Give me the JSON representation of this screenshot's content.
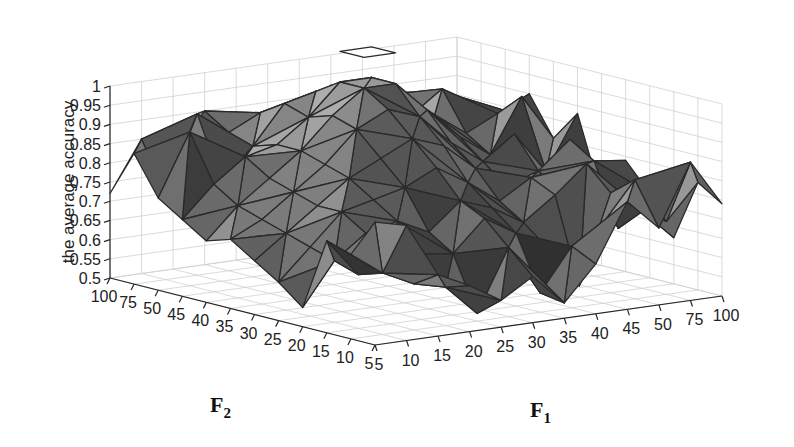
{
  "chart_data": {
    "type": "surface3d",
    "title": "",
    "zlabel": "the average accuracy",
    "xlabel": "F1",
    "ylabel": "F2",
    "xlabel_main": "F",
    "xlabel_sub": "1",
    "ylabel_main": "F",
    "ylabel_sub": "2",
    "x_ticks": [
      "5",
      "10",
      "15",
      "20",
      "25",
      "30",
      "35",
      "40",
      "45",
      "50",
      "75",
      "100"
    ],
    "y_ticks": [
      "5",
      "10",
      "15",
      "20",
      "25",
      "30",
      "35",
      "40",
      "45",
      "50",
      "75",
      "100"
    ],
    "z_ticks": [
      "0.5",
      "0.55",
      "0.6",
      "0.65",
      "0.7",
      "0.75",
      "0.8",
      "0.85",
      "0.9",
      "0.95",
      "1"
    ],
    "zlim": [
      0.5,
      1.0
    ],
    "grid": true,
    "colormap": "gray (faceted shading)",
    "z": [
      [
        0.82,
        0.8,
        0.66,
        0.62,
        0.57,
        0.62,
        0.54,
        0.63,
        0.78,
        0.7,
        0.86,
        0.74
      ],
      [
        0.72,
        0.66,
        0.62,
        0.6,
        0.52,
        0.68,
        0.55,
        0.66,
        0.71,
        0.81,
        0.69,
        0.78
      ],
      [
        0.74,
        0.64,
        0.7,
        0.67,
        0.66,
        0.74,
        0.69,
        0.64,
        0.53,
        0.76,
        0.7,
        0.62
      ],
      [
        0.55,
        0.66,
        0.72,
        0.74,
        0.7,
        0.77,
        0.74,
        0.69,
        0.75,
        0.82,
        0.64,
        0.72
      ],
      [
        0.6,
        0.68,
        0.76,
        0.78,
        0.8,
        0.84,
        0.79,
        0.73,
        0.78,
        0.72,
        0.8,
        0.79
      ],
      [
        0.64,
        0.7,
        0.76,
        0.82,
        0.86,
        0.9,
        0.87,
        0.8,
        0.74,
        0.77,
        0.84,
        0.68
      ],
      [
        0.68,
        0.72,
        0.78,
        0.84,
        0.92,
        0.96,
        0.93,
        0.85,
        0.79,
        0.85,
        0.74,
        0.88
      ],
      [
        0.66,
        0.74,
        0.8,
        0.86,
        0.94,
        1.0,
        1.0,
        0.92,
        0.84,
        0.78,
        0.92,
        0.8
      ],
      [
        0.7,
        0.78,
        0.84,
        0.86,
        0.92,
        1.0,
        1.0,
        0.94,
        0.88,
        0.82,
        0.86,
        0.9
      ],
      [
        0.74,
        0.9,
        0.76,
        0.84,
        0.94,
        0.96,
        0.96,
        0.9,
        0.86,
        0.92,
        0.8,
        0.84
      ],
      [
        0.84,
        0.72,
        0.92,
        0.86,
        0.9,
        0.88,
        0.93,
        0.84,
        0.9,
        0.8,
        0.88,
        0.78
      ],
      [
        0.72,
        0.85,
        0.8,
        0.9,
        0.84,
        0.88,
        0.86,
        0.92,
        0.82,
        0.88,
        0.84,
        0.8
      ]
    ],
    "z_note": "z[i][j]: i indexes F2 tick (5..100), j indexes F1 tick (5..100); values estimated from the rendered surface"
  },
  "layout": {
    "origin_front": [
      375,
      345
    ],
    "x_end": [
      722,
      296
    ],
    "y_end": [
      110,
      278
    ],
    "z_unit_px": 384,
    "background": "#ffffff",
    "grid_color": "#d0d0d0"
  }
}
